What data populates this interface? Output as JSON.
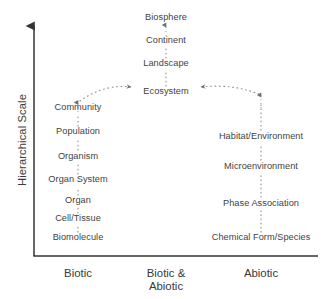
{
  "figure": {
    "axes": {
      "y_title": "Hierarchical Scale",
      "x_categories": [
        {
          "label": "Biotic",
          "x": 78
        },
        {
          "label": "Biotic &\nAbiotic",
          "x": 166
        },
        {
          "label": "Abiotic",
          "x": 261
        }
      ]
    },
    "colors": {
      "axis": "#333333",
      "text": "#3a3a3a",
      "connector": "#8a8a8a"
    },
    "columns": {
      "biotic": {
        "name": "Biotic",
        "x": 78,
        "nodes": [
          {
            "label": "Community",
            "y": 108
          },
          {
            "label": "Population",
            "y": 132
          },
          {
            "label": "Organism",
            "y": 157
          },
          {
            "label": "Organ System",
            "y": 180
          },
          {
            "label": "Organ",
            "y": 201
          },
          {
            "label": "Cell/Tissue",
            "y": 219
          },
          {
            "label": "Biomolecule",
            "y": 238
          }
        ]
      },
      "biotic_abiotic": {
        "name": "Biotic & Abiotic",
        "x": 166,
        "nodes": [
          {
            "label": "Biosphere",
            "y": 18
          },
          {
            "label": "Continent",
            "y": 41
          },
          {
            "label": "Landscape",
            "y": 64
          },
          {
            "label": "Ecosystem",
            "y": 92
          }
        ]
      },
      "abiotic": {
        "name": "Abiotic",
        "x": 261,
        "nodes": [
          {
            "label": "Habitat/Environment",
            "y": 137
          },
          {
            "label": "Microenvironment",
            "y": 167
          },
          {
            "label": "Phase Association",
            "y": 204
          },
          {
            "label": "Chemical Form/Species",
            "y": 238
          }
        ]
      }
    },
    "connections": [
      {
        "from": "Biomolecule",
        "to": "Cell/Tissue",
        "style": "dotted-arrow-up"
      },
      {
        "from": "Cell/Tissue",
        "to": "Organ",
        "style": "dotted-arrow-up"
      },
      {
        "from": "Organ",
        "to": "Organ System",
        "style": "dotted-arrow-up"
      },
      {
        "from": "Organ System",
        "to": "Organism",
        "style": "dotted-arrow-up"
      },
      {
        "from": "Organism",
        "to": "Population",
        "style": "dotted-arrow-up"
      },
      {
        "from": "Population",
        "to": "Community",
        "style": "dotted-arrow-up"
      },
      {
        "from": "Community",
        "to": "Ecosystem",
        "style": "dotted-arc-right"
      },
      {
        "from": "Chemical Form/Species",
        "to": "Phase Association",
        "style": "dotted-arrow-up"
      },
      {
        "from": "Phase Association",
        "to": "Microenvironment",
        "style": "dotted-arrow-up"
      },
      {
        "from": "Microenvironment",
        "to": "Habitat/Environment",
        "style": "dotted-arrow-up"
      },
      {
        "from": "Habitat/Environment",
        "to": "Ecosystem",
        "style": "dotted-arc-left"
      },
      {
        "from": "Ecosystem",
        "to": "Landscape",
        "style": "dotted-arrow-up"
      },
      {
        "from": "Landscape",
        "to": "Continent",
        "style": "dotted-arrow-up"
      },
      {
        "from": "Continent",
        "to": "Biosphere",
        "style": "dotted-arrow-up"
      }
    ]
  }
}
